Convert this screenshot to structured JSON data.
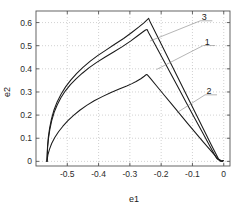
{
  "chart_data": {
    "type": "line",
    "title": "",
    "xlabel": "e1",
    "ylabel": "e2",
    "xlim": [
      -0.6,
      0.02
    ],
    "ylim": [
      -0.02,
      0.65
    ],
    "xticks": [
      -0.5,
      -0.4,
      -0.3,
      -0.2,
      -0.1,
      0
    ],
    "xticklabels": [
      "-0.5",
      "-0.4",
      "-0.3",
      "-0.2",
      "-0.1",
      "0"
    ],
    "yticks": [
      0,
      0.1,
      0.2,
      0.3,
      0.4,
      0.5,
      0.6
    ],
    "yticklabels": [
      "0",
      "0.1",
      "0.2",
      "0.3",
      "0.4",
      "0.5",
      "0.6"
    ],
    "grid": true,
    "grid_style": "dotted",
    "grid_color": "#b4b4b4",
    "axis_color": "#555555",
    "line_color": "#1a1a1a",
    "legend": "inline-labels",
    "series": [
      {
        "name": "1",
        "label": "1",
        "label_xy": [
          -0.053,
          0.505
        ],
        "leader_to": [
          -0.215,
          0.397
        ],
        "points": [
          [
            -0.565,
            0.0
          ],
          [
            -0.563,
            0.06
          ],
          [
            -0.56,
            0.1
          ],
          [
            -0.556,
            0.136
          ],
          [
            -0.55,
            0.175
          ],
          [
            -0.542,
            0.212
          ],
          [
            -0.532,
            0.245
          ],
          [
            -0.52,
            0.276
          ],
          [
            -0.506,
            0.305
          ],
          [
            -0.49,
            0.332
          ],
          [
            -0.472,
            0.357
          ],
          [
            -0.452,
            0.381
          ],
          [
            -0.43,
            0.405
          ],
          [
            -0.406,
            0.428
          ],
          [
            -0.38,
            0.45
          ],
          [
            -0.352,
            0.473
          ],
          [
            -0.324,
            0.496
          ],
          [
            -0.298,
            0.52
          ],
          [
            -0.276,
            0.542
          ],
          [
            -0.26,
            0.558
          ],
          [
            -0.25,
            0.568
          ],
          [
            -0.245,
            0.57
          ],
          [
            -0.24,
            0.556
          ],
          [
            -0.22,
            0.506
          ],
          [
            -0.195,
            0.444
          ],
          [
            -0.17,
            0.381
          ],
          [
            -0.145,
            0.318
          ],
          [
            -0.12,
            0.255
          ],
          [
            -0.095,
            0.192
          ],
          [
            -0.07,
            0.13
          ],
          [
            -0.045,
            0.068
          ],
          [
            -0.023,
            0.013
          ],
          [
            -0.01,
            0.0
          ],
          [
            -0.003,
            0.003
          ]
        ]
      },
      {
        "name": "2",
        "label": "2",
        "label_xy": [
          -0.047,
          0.292
        ],
        "leader_to": [
          -0.15,
          0.21
        ],
        "points": [
          [
            -0.565,
            0.0
          ],
          [
            -0.562,
            0.028
          ],
          [
            -0.557,
            0.052
          ],
          [
            -0.55,
            0.077
          ],
          [
            -0.54,
            0.103
          ],
          [
            -0.528,
            0.128
          ],
          [
            -0.514,
            0.152
          ],
          [
            -0.498,
            0.176
          ],
          [
            -0.48,
            0.199
          ],
          [
            -0.46,
            0.221
          ],
          [
            -0.438,
            0.242
          ],
          [
            -0.414,
            0.262
          ],
          [
            -0.388,
            0.28
          ],
          [
            -0.362,
            0.297
          ],
          [
            -0.336,
            0.312
          ],
          [
            -0.31,
            0.326
          ],
          [
            -0.295,
            0.335
          ],
          [
            -0.28,
            0.345
          ],
          [
            -0.265,
            0.357
          ],
          [
            -0.254,
            0.368
          ],
          [
            -0.248,
            0.375
          ],
          [
            -0.244,
            0.374
          ],
          [
            -0.235,
            0.36
          ],
          [
            -0.215,
            0.327
          ],
          [
            -0.19,
            0.286
          ],
          [
            -0.165,
            0.245
          ],
          [
            -0.14,
            0.204
          ],
          [
            -0.115,
            0.163
          ],
          [
            -0.09,
            0.123
          ],
          [
            -0.065,
            0.083
          ],
          [
            -0.04,
            0.044
          ],
          [
            -0.018,
            0.01
          ],
          [
            -0.006,
            0.0
          ],
          [
            -0.002,
            0.003
          ]
        ]
      },
      {
        "name": "3",
        "label": "3",
        "label_xy": [
          -0.062,
          0.612
        ],
        "leader_to": [
          -0.236,
          0.52
        ],
        "points": [
          [
            -0.565,
            0.0
          ],
          [
            -0.5632,
            0.062
          ],
          [
            -0.5605,
            0.106
          ],
          [
            -0.5565,
            0.144
          ],
          [
            -0.5505,
            0.184
          ],
          [
            -0.5425,
            0.222
          ],
          [
            -0.5325,
            0.257
          ],
          [
            -0.52,
            0.29
          ],
          [
            -0.5055,
            0.322
          ],
          [
            -0.489,
            0.351
          ],
          [
            -0.4705,
            0.379
          ],
          [
            -0.45,
            0.406
          ],
          [
            -0.4275,
            0.432
          ],
          [
            -0.403,
            0.457
          ],
          [
            -0.3765,
            0.481
          ],
          [
            -0.3485,
            0.506
          ],
          [
            -0.32,
            0.531
          ],
          [
            -0.294,
            0.557
          ],
          [
            -0.272,
            0.58
          ],
          [
            -0.256,
            0.598
          ],
          [
            -0.245,
            0.612
          ],
          [
            -0.24,
            0.618
          ],
          [
            -0.235,
            0.602
          ],
          [
            -0.215,
            0.548
          ],
          [
            -0.19,
            0.48
          ],
          [
            -0.165,
            0.412
          ],
          [
            -0.14,
            0.344
          ],
          [
            -0.115,
            0.276
          ],
          [
            -0.09,
            0.208
          ],
          [
            -0.065,
            0.14
          ],
          [
            -0.04,
            0.072
          ],
          [
            -0.017,
            0.011
          ],
          [
            -0.005,
            0.0
          ],
          [
            -0.001,
            0.004
          ]
        ]
      }
    ]
  }
}
